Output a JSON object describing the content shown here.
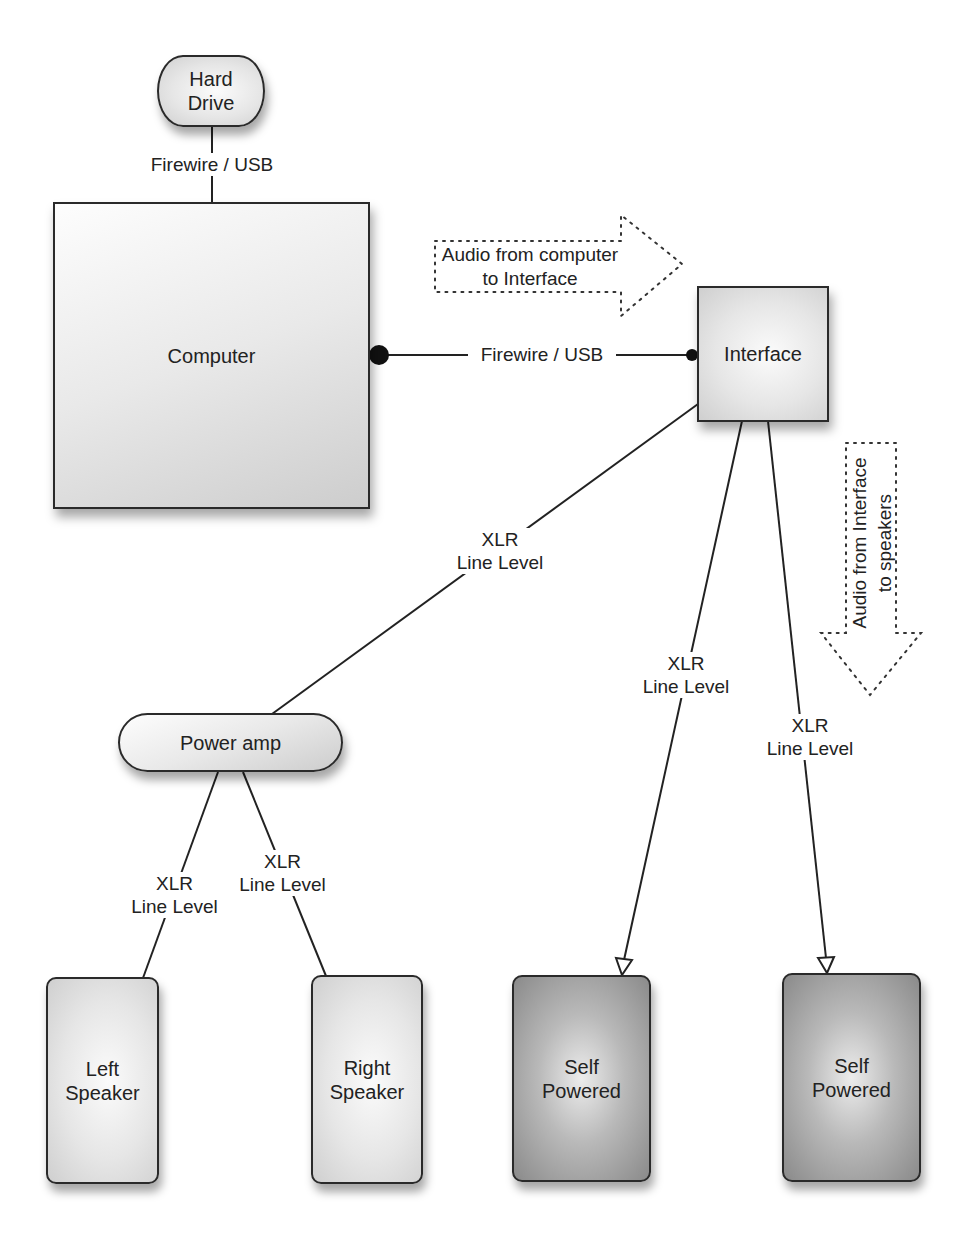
{
  "diagram": {
    "nodes": {
      "hard_drive": {
        "line1": "Hard",
        "line2": "Drive"
      },
      "computer": {
        "label": "Computer"
      },
      "interface": {
        "label": "Interface"
      },
      "power_amp": {
        "label": "Power amp"
      },
      "left_speaker": {
        "line1": "Left",
        "line2": "Speaker"
      },
      "right_speaker": {
        "line1": "Right",
        "line2": "Speaker"
      },
      "self_powered_1": {
        "line1": "Self",
        "line2": "Powered"
      },
      "self_powered_2": {
        "line1": "Self",
        "line2": "Powered"
      }
    },
    "connections": {
      "drive_to_computer": {
        "label": "Firewire / USB"
      },
      "computer_to_interface": {
        "label": "Firewire / USB"
      },
      "interface_to_amp": {
        "line1": "XLR",
        "line2": "Line Level"
      },
      "interface_to_self1": {
        "line1": "XLR",
        "line2": "Line Level"
      },
      "interface_to_self2": {
        "line1": "XLR",
        "line2": "Line Level"
      },
      "amp_to_left": {
        "line1": "XLR",
        "line2": "Line Level"
      },
      "amp_to_right": {
        "line1": "XLR",
        "line2": "Line Level"
      }
    },
    "flow_arrows": {
      "computer_to_interface": {
        "line1": "Audio from computer",
        "line2": "to Interface"
      },
      "interface_to_speakers": {
        "line1": "Audio from Interface",
        "line2": "to speakers"
      }
    }
  }
}
